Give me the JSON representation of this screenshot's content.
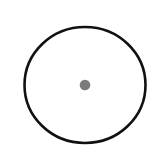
{
  "diagram": {
    "shapes": [
      {
        "type": "circle",
        "name": "outer-circle",
        "cx": 85,
        "cy": 85,
        "rx": 60.5,
        "ry": 58,
        "stroke": "#111111",
        "stroke_width": 2.6,
        "fill": "none"
      },
      {
        "type": "dot",
        "name": "center-dot",
        "cx": 85,
        "cy": 85,
        "r": 5.3,
        "fill": "#7a7a7a"
      }
    ]
  },
  "colors": {
    "background": "#ffffff",
    "circle_stroke": "#111111",
    "dot_fill": "#7a7a7a"
  }
}
